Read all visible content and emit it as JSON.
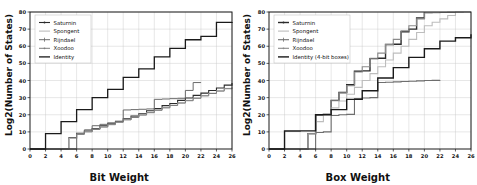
{
  "figure": {
    "background": "#ffffff",
    "panels": [
      "left",
      "right"
    ]
  },
  "chart_data": [
    {
      "id": "left",
      "type": "line",
      "drawstyle": "steps-post",
      "title": "",
      "xlabel": "Bit Weight",
      "ylabel": "Log2(Number of States)",
      "xlim": [
        0,
        26
      ],
      "ylim": [
        0,
        80
      ],
      "xticks": [
        0,
        2,
        4,
        6,
        8,
        10,
        12,
        14,
        16,
        18,
        20,
        22,
        24,
        26
      ],
      "yticks": [
        0,
        10,
        20,
        30,
        40,
        50,
        60,
        70,
        80
      ],
      "grid": true,
      "legend_position": "upper left",
      "series": [
        {
          "name": "Saturnin",
          "color": "#2b2b2b",
          "width": 1.1,
          "marker": "line-dot",
          "x": [
            0,
            4,
            5,
            6,
            7,
            8,
            9,
            10,
            11,
            12,
            13,
            14,
            15,
            16,
            17,
            18,
            19,
            20,
            21,
            22,
            23,
            24,
            25,
            26
          ],
          "y": [
            0,
            0,
            6.5,
            9.2,
            10.5,
            12.0,
            13.5,
            15.0,
            16.2,
            17.6,
            19.2,
            20.6,
            22.3,
            23.6,
            25.3,
            26.6,
            28.4,
            29.8,
            31.3,
            32.6,
            34.2,
            35.6,
            37.3,
            38.6
          ]
        },
        {
          "name": "Spongent",
          "color": "#b5b5b5",
          "width": 1.0,
          "marker": "line",
          "x": [
            0,
            4,
            5,
            6,
            7,
            8,
            9,
            10,
            11,
            12,
            13,
            14,
            15,
            16,
            17,
            18,
            19,
            20,
            21,
            22,
            23,
            24,
            25,
            26
          ],
          "y": [
            0,
            0,
            6.2,
            8.8,
            10.2,
            11.6,
            13.0,
            14.4,
            15.8,
            17.2,
            18.6,
            20.0,
            21.4,
            22.8,
            24.2,
            25.6,
            27.0,
            28.4,
            29.8,
            31.2,
            32.6,
            34.0,
            35.4,
            35.6
          ]
        },
        {
          "name": "Rijndael",
          "color": "#6a6a6a",
          "width": 1.0,
          "marker": "line-plus",
          "x": [
            0,
            5,
            6,
            7,
            8,
            9,
            10,
            11,
            12,
            13,
            14,
            15,
            16,
            17,
            18,
            19,
            20,
            21,
            22
          ],
          "y": [
            0,
            0,
            8.8,
            11.2,
            13.6,
            14.4,
            15.2,
            16.0,
            22.8,
            23.0,
            23.2,
            23.4,
            29.0,
            29.2,
            29.4,
            29.6,
            34.2,
            38.8,
            38.9
          ]
        },
        {
          "name": "Xoodoo",
          "color": "#7d7d7d",
          "width": 1.0,
          "marker": "line-dot",
          "x": [
            0,
            5,
            6,
            7,
            8,
            9,
            10,
            11,
            12,
            13,
            14,
            15,
            16,
            17,
            18,
            19,
            20,
            21,
            22,
            23,
            24,
            25,
            26
          ],
          "y": [
            0,
            0,
            8.6,
            10.0,
            11.4,
            12.8,
            14.2,
            15.6,
            17.0,
            18.4,
            19.8,
            21.2,
            22.6,
            24.0,
            25.4,
            26.8,
            28.2,
            29.6,
            31.0,
            32.4,
            33.8,
            35.2,
            36.0
          ]
        },
        {
          "name": "Identity",
          "color": "#1a1a1a",
          "width": 1.3,
          "marker": "line",
          "x": [
            0,
            2,
            4,
            6,
            8,
            10,
            12,
            14,
            16,
            18,
            20,
            22,
            24,
            26
          ],
          "y": [
            0,
            9.0,
            16.0,
            23.0,
            30.0,
            34.8,
            41.8,
            46.8,
            53.8,
            58.8,
            63.8,
            65.8,
            74.0,
            74.2
          ]
        }
      ]
    },
    {
      "id": "right",
      "type": "line",
      "drawstyle": "steps-post",
      "title": "",
      "xlabel": "Box Weight",
      "ylabel": "Log2(Number of States)",
      "xlim": [
        0,
        26
      ],
      "ylim": [
        0,
        80
      ],
      "xticks": [
        0,
        2,
        4,
        6,
        8,
        10,
        12,
        14,
        16,
        18,
        20,
        22,
        24,
        26
      ],
      "yticks": [
        0,
        10,
        20,
        30,
        40,
        50,
        60,
        70,
        80
      ],
      "grid": true,
      "legend_position": "upper left",
      "series": [
        {
          "name": "Saturnin",
          "color": "#2b2b2b",
          "width": 1.4,
          "marker": "line-dot",
          "x": [
            0,
            4,
            5,
            6,
            7,
            8,
            9,
            10,
            11,
            12,
            13,
            14,
            15,
            16,
            17,
            18,
            19,
            20
          ],
          "y": [
            0,
            0,
            9.0,
            20.0,
            20.2,
            28.4,
            33.0,
            37.5,
            45.4,
            45.6,
            52.8,
            53.0,
            61.0,
            61.2,
            68.5,
            70.0,
            76.5,
            79.8
          ]
        },
        {
          "name": "Spongent",
          "color": "#bdbdbd",
          "width": 1.1,
          "marker": "line",
          "x": [
            0,
            4,
            5,
            6,
            7,
            8,
            9,
            10,
            11,
            12,
            13,
            14,
            15,
            16,
            17,
            18,
            19,
            20,
            21,
            22,
            23,
            24
          ],
          "y": [
            0,
            0,
            8.8,
            16.0,
            20.0,
            24.0,
            28.0,
            32.0,
            36.0,
            40.0,
            44.0,
            48.0,
            52.0,
            56.0,
            60.0,
            64.0,
            68.0,
            72.0,
            74.0,
            76.0,
            78.0,
            79.6
          ]
        },
        {
          "name": "Rijndael",
          "color": "#6e6e6e",
          "width": 1.1,
          "marker": "line-plus",
          "x": [
            0,
            5,
            6,
            7,
            8,
            9,
            10,
            11,
            12,
            13,
            14,
            15,
            16,
            17,
            18,
            19,
            20,
            21,
            22
          ],
          "y": [
            0,
            0,
            9.6,
            10.0,
            19.6,
            20.0,
            20.2,
            29.4,
            29.8,
            30.0,
            38.8,
            39.0,
            39.2,
            39.4,
            39.6,
            39.8,
            40.0,
            40.1,
            40.2
          ]
        },
        {
          "name": "Xoodoo",
          "color": "#8a8a8a",
          "width": 1.1,
          "marker": "line-dot",
          "x": [
            0,
            4,
            5,
            6,
            7,
            8,
            9,
            10,
            11,
            12,
            13,
            14,
            15,
            16,
            17,
            18,
            19,
            20,
            21,
            22,
            23,
            24,
            25,
            26
          ],
          "y": [
            0,
            0,
            9.0,
            20.0,
            20.2,
            28.2,
            32.8,
            37.0,
            45.0,
            48.0,
            53.0,
            56.0,
            61.0,
            64.0,
            69.0,
            72.0,
            76.0,
            79.5,
            79.6,
            79.7,
            79.8,
            79.9,
            80.0,
            80.0
          ]
        },
        {
          "name": "Identity (4-bit boxes)",
          "color": "#1a1a1a",
          "width": 1.4,
          "marker": "line",
          "x": [
            0,
            2,
            4,
            6,
            8,
            10,
            12,
            14,
            16,
            18,
            20,
            22,
            24,
            26
          ],
          "y": [
            0,
            10.5,
            10.6,
            20.0,
            23.0,
            29.0,
            34.0,
            41.5,
            47.5,
            53.5,
            58.5,
            63.0,
            65.0,
            67.0
          ]
        }
      ]
    }
  ]
}
